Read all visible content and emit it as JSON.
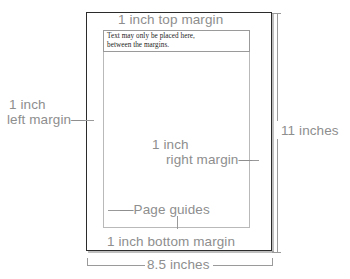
{
  "figure": {
    "background_color": "#ffffff",
    "page_border_color": "#2b2b2b",
    "guide_color": "#b9b9b9",
    "label_color": "#8e8e8e"
  },
  "page": {
    "body_text": {
      "line1": "Text may only be placed here,",
      "line2": "between the margins."
    }
  },
  "labels": {
    "top_margin": "1 inch top margin",
    "left_margin_line1": "1 inch",
    "left_margin_line2": "left margin—",
    "right_margin_line1": "1 inch",
    "right_margin_line2": "right margin—",
    "bottom_margin": "1 inch bottom margin",
    "page_guides": "—Page guides"
  },
  "dimensions": {
    "height": "11 inches",
    "width": "8.5 inches"
  }
}
